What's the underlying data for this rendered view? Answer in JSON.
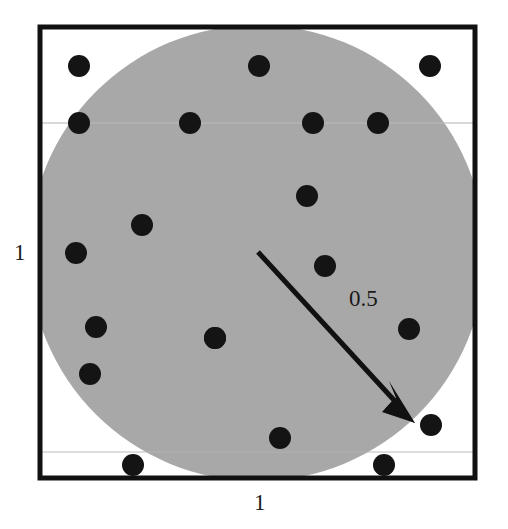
{
  "figure": {
    "background_color": "#ffffff"
  },
  "labels": {
    "left_side": "1",
    "bottom_side": "1",
    "radius": "0.5"
  },
  "chart_data": {
    "type": "scatter",
    "title": "",
    "xlabel": "1",
    "ylabel": "1",
    "xlim": [
      0,
      1
    ],
    "ylim": [
      0,
      1
    ],
    "grid": false,
    "legend": null,
    "annotations": [
      {
        "text": "1",
        "role": "square-side-length-vertical",
        "position": "left-of-square-midheight"
      },
      {
        "text": "1",
        "role": "square-side-length-horizontal",
        "position": "below-square-midwidth"
      },
      {
        "text": "0.5",
        "role": "circle-radius",
        "position": "beside-radius-arrow"
      }
    ],
    "shapes": [
      {
        "name": "unit-square",
        "kind": "rect",
        "x": 0.0,
        "y": 0.0,
        "width": 1.0,
        "height": 1.0,
        "fill": "#ffffff",
        "stroke": "#111111",
        "stroke_width_px": 5
      },
      {
        "name": "inscribed-circle",
        "kind": "circle",
        "cx": 0.5,
        "cy": 0.5,
        "r": 0.5,
        "fill": "#a8a8a8",
        "stroke": "none"
      },
      {
        "name": "radius-arrow",
        "kind": "arrow",
        "from": [
          0.5,
          0.5
        ],
        "to": [
          0.855,
          0.131
        ],
        "label": "0.5",
        "color": "#111111"
      }
    ],
    "points": {
      "name": "random-sample-points",
      "marker": "filled-circle",
      "color": "#141414",
      "radius_px": 11,
      "count": 20,
      "x": [
        0.094,
        0.094,
        0.347,
        0.504,
        0.628,
        0.775,
        0.893,
        0.573,
        0.237,
        0.613,
        0.087,
        0.132,
        0.401,
        0.846,
        0.118,
        0.399,
        0.166,
        0.552,
        0.896,
        0.789
      ],
      "y": [
        0.891,
        0.766,
        0.766,
        0.891,
        0.766,
        0.766,
        0.891,
        0.875,
        0.625,
        0.469,
        0.54,
        0.434,
        0.431,
        0.434,
        0.336,
        0.318,
        0.231,
        0.095,
        0.122,
        0.035
      ],
      "px": [
        79,
        79,
        190,
        259,
        313,
        378,
        430,
        307,
        142,
        325,
        76,
        96,
        215,
        409,
        90,
        215,
        133,
        280,
        431,
        384
      ],
      "py": [
        66,
        123,
        123,
        66,
        123,
        123,
        66,
        196,
        225,
        266,
        253,
        327,
        338,
        329,
        374,
        338,
        465,
        438,
        425,
        465
      ]
    }
  }
}
